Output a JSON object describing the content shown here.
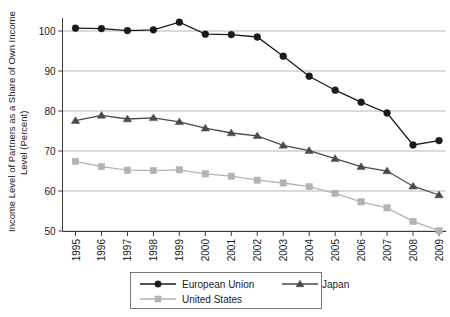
{
  "chart_data": {
    "type": "line",
    "title": "",
    "xlabel": "",
    "ylabel": "Income Level of Partners as a Share of Own Income Level (Percent)",
    "ylabel_line1": "Income Level of Partners as a Share of Own Income",
    "ylabel_line2": "Level (Percent)",
    "categories": [
      "1995",
      "1996",
      "1997",
      "1998",
      "1999",
      "2000",
      "2001",
      "2002",
      "2003",
      "2004",
      "2005",
      "2006",
      "2007",
      "2008",
      "2009"
    ],
    "x": [
      1995,
      1996,
      1997,
      1998,
      1999,
      2000,
      2001,
      2002,
      2003,
      2004,
      2005,
      2006,
      2007,
      2008,
      2009
    ],
    "ylim": [
      50,
      105
    ],
    "yticks": [
      50,
      60,
      70,
      80,
      90,
      100
    ],
    "ytick_labels": [
      "50",
      "60",
      "70",
      "80",
      "90",
      "100"
    ],
    "grid": true,
    "grid_axis": "y",
    "legend_position": "bottom",
    "series": [
      {
        "name": "European Union",
        "marker": "circle",
        "color": "#1a1a1a",
        "values": [
          100.7,
          100.6,
          100.1,
          100.3,
          102.2,
          99.2,
          99.1,
          98.5,
          93.7,
          88.7,
          85.2,
          82.2,
          79.5,
          71.5,
          72.6
        ]
      },
      {
        "name": "Japan",
        "marker": "triangle",
        "color": "#4a4a4a",
        "values": [
          77.6,
          78.9,
          78.0,
          78.3,
          77.3,
          75.7,
          74.5,
          73.8,
          71.4,
          70.1,
          68.1,
          66.1,
          65.0,
          61.2,
          59.0
        ]
      },
      {
        "name": "United States",
        "marker": "square",
        "color": "#b3b3b3",
        "values": [
          67.4,
          66.1,
          65.2,
          65.1,
          65.3,
          64.3,
          63.7,
          62.7,
          62.0,
          61.1,
          59.4,
          57.3,
          55.8,
          52.4,
          50.1
        ]
      }
    ]
  },
  "legend": {
    "items": [
      {
        "label": "European Union",
        "marker": "circle",
        "color": "#1a1a1a"
      },
      {
        "label": "Japan",
        "marker": "triangle",
        "color": "#4a4a4a"
      },
      {
        "label": "United States",
        "marker": "square",
        "color": "#b3b3b3"
      }
    ]
  }
}
